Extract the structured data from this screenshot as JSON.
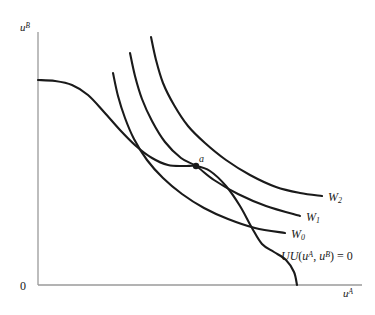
{
  "figure": {
    "background_color": "#ffffff",
    "curve_color": "#1a1a1a",
    "axis_color": "#9a9a9a"
  },
  "axes": {
    "y_label": "u",
    "y_label_sup": "B",
    "x_label": "u",
    "x_label_sup": "A",
    "origin_label": "0"
  },
  "labels": {
    "w2": "W",
    "w2_sub": "2",
    "w1": "W",
    "w1_sub": "1",
    "w0": "W",
    "w0_sub": "0",
    "uu_part1": "UU",
    "uu_open": "(",
    "uu_uA": "u",
    "uu_uA_sup": "A",
    "uu_comma": ", ",
    "uu_uB": "u",
    "uu_uB_sup": "B",
    "uu_close": ")",
    "uu_eq": " = 0",
    "point_a": "a"
  },
  "chart_data": {
    "type": "line",
    "title": "",
    "xlabel": "u^A",
    "ylabel": "u^B",
    "grid": false,
    "legend": "inline-right-end",
    "annotations": [
      {
        "text": "a",
        "x": 196,
        "y": 166,
        "description": "tangency point of W1 social indifference curve with the UU utility possibility frontier"
      }
    ],
    "series": [
      {
        "name": "UU(u^A, u^B) = 0",
        "label": "UU(u^A, u^B) = 0",
        "role": "utility-possibility-frontier",
        "points": [
          [
            38,
            80
          ],
          [
            55,
            81
          ],
          [
            72,
            85
          ],
          [
            88,
            95
          ],
          [
            104,
            112
          ],
          [
            120,
            130
          ],
          [
            136,
            146
          ],
          [
            152,
            158
          ],
          [
            168,
            165
          ],
          [
            184,
            166
          ],
          [
            196,
            166
          ],
          [
            210,
            171
          ],
          [
            226,
            186
          ],
          [
            240,
            206
          ],
          [
            252,
            228
          ],
          [
            262,
            244
          ],
          [
            274,
            252
          ],
          [
            286,
            260
          ],
          [
            294,
            272
          ],
          [
            297,
            285
          ]
        ]
      },
      {
        "name": "W0",
        "label": "W0",
        "role": "social-indifference-curve",
        "points": [
          [
            113,
            73
          ],
          [
            118,
            96
          ],
          [
            125,
            118
          ],
          [
            134,
            139
          ],
          [
            147,
            160
          ],
          [
            163,
            178
          ],
          [
            182,
            194
          ],
          [
            204,
            208
          ],
          [
            228,
            219
          ],
          [
            255,
            228
          ],
          [
            285,
            233
          ]
        ]
      },
      {
        "name": "W1",
        "label": "W1",
        "role": "social-indifference-curve",
        "points": [
          [
            130,
            53
          ],
          [
            135,
            76
          ],
          [
            142,
            99
          ],
          [
            152,
            121
          ],
          [
            165,
            142
          ],
          [
            181,
            158
          ],
          [
            196,
            166
          ],
          [
            214,
            180
          ],
          [
            238,
            194
          ],
          [
            266,
            206
          ],
          [
            300,
            216
          ]
        ]
      },
      {
        "name": "W2",
        "label": "W2",
        "role": "social-indifference-curve",
        "points": [
          [
            151,
            37
          ],
          [
            156,
            60
          ],
          [
            163,
            83
          ],
          [
            174,
            105
          ],
          [
            188,
            126
          ],
          [
            205,
            143
          ],
          [
            226,
            160
          ],
          [
            250,
            175
          ],
          [
            276,
            187
          ],
          [
            300,
            193
          ],
          [
            322,
            196
          ]
        ]
      }
    ]
  }
}
